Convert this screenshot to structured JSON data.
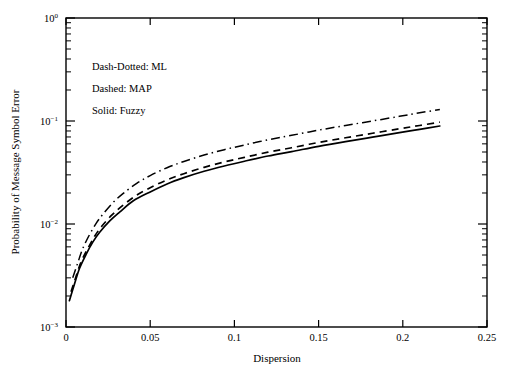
{
  "chart_data": {
    "type": "line",
    "title": "",
    "xlabel": "Dispersion",
    "ylabel": "Probability of Message Symbol Error",
    "xlim": [
      0,
      0.25
    ],
    "ylim": [
      0.001,
      1
    ],
    "yscale": "log",
    "xscale": "linear",
    "grid": false,
    "legend_position": "upper-left-inside",
    "xticklabels": [
      "0",
      "0.05",
      "0.1",
      "0.15",
      "0.2",
      "0.25"
    ],
    "xtickvalues": [
      0,
      0.05,
      0.1,
      0.15,
      0.2,
      0.25
    ],
    "yticklabels": [
      "10⁰",
      "10⁻¹",
      "10⁻²",
      "10⁻³"
    ],
    "ytickvalues": [
      1,
      0.1,
      0.01,
      0.001
    ],
    "ytick_bases": [
      "10",
      "10",
      "10",
      "10"
    ],
    "ytick_exponents": [
      "0",
      "-1",
      "-2",
      "-3"
    ],
    "annotations": [
      "Dash-Dotted: ML",
      "Dashed: MAP",
      "Solid: Fuzzy"
    ],
    "series": [
      {
        "name": "ML",
        "style": "dash-dotted",
        "color": "#000000",
        "x": [
          0.004,
          0.007,
          0.01,
          0.014,
          0.018,
          0.022,
          0.028,
          0.034,
          0.042,
          0.05,
          0.06,
          0.07,
          0.082,
          0.094,
          0.106,
          0.12,
          0.134,
          0.15,
          0.166,
          0.182,
          0.198,
          0.21,
          0.222
        ],
        "y": [
          0.003,
          0.0042,
          0.0058,
          0.0079,
          0.0102,
          0.0125,
          0.0162,
          0.0198,
          0.0248,
          0.0295,
          0.0352,
          0.0405,
          0.0467,
          0.0527,
          0.0585,
          0.0657,
          0.0726,
          0.0815,
          0.0905,
          0.1,
          0.111,
          0.12,
          0.1295
        ]
      },
      {
        "name": "MAP",
        "style": "dashed",
        "color": "#000000",
        "x": [
          0.003,
          0.006,
          0.009,
          0.013,
          0.017,
          0.021,
          0.027,
          0.033,
          0.041,
          0.05,
          0.06,
          0.07,
          0.082,
          0.094,
          0.106,
          0.12,
          0.134,
          0.15,
          0.166,
          0.182,
          0.198,
          0.21,
          0.222
        ],
        "y": [
          0.0022,
          0.0031,
          0.0043,
          0.0058,
          0.0076,
          0.0094,
          0.0121,
          0.0148,
          0.0186,
          0.0225,
          0.0268,
          0.0308,
          0.0355,
          0.04,
          0.0444,
          0.0498,
          0.055,
          0.0619,
          0.0688,
          0.076,
          0.084,
          0.0905,
          0.0975
        ]
      },
      {
        "name": "Fuzzy",
        "style": "solid",
        "color": "#000000",
        "x": [
          0.002,
          0.005,
          0.008,
          0.012,
          0.016,
          0.02,
          0.026,
          0.032,
          0.04,
          0.05,
          0.06,
          0.07,
          0.082,
          0.094,
          0.106,
          0.12,
          0.134,
          0.15,
          0.166,
          0.182,
          0.198,
          0.21,
          0.222
        ],
        "y": [
          0.0018,
          0.0026,
          0.0037,
          0.0051,
          0.0067,
          0.0083,
          0.0107,
          0.0131,
          0.0168,
          0.0205,
          0.0245,
          0.0282,
          0.0325,
          0.0366,
          0.0407,
          0.0457,
          0.0505,
          0.0568,
          0.0631,
          0.0697,
          0.077,
          0.083,
          0.0894
        ]
      }
    ]
  }
}
